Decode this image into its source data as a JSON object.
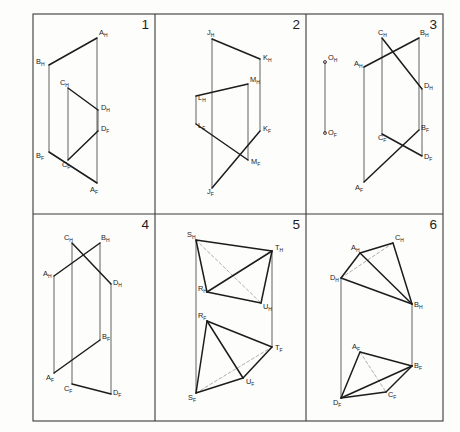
{
  "sheet": {
    "title": "Descriptive Geometry Worksheet",
    "background_color": "#fdfdfb",
    "line_color": "#1c1c1c",
    "hidden_line_color": "#9a9a9a",
    "border_color": "#3a3a3a",
    "grid": {
      "columns": 3,
      "rows": 2
    }
  },
  "panels": [
    {
      "number": "1",
      "kind": "two-skew-lines",
      "description": "Two line segments AB and CD shown in H and F views with vertical projection lines",
      "points": [
        {
          "name": "A_H",
          "label": "A",
          "sub": "H",
          "x": 97,
          "y": 38,
          "lx": 99,
          "ly": 35
        },
        {
          "name": "B_H",
          "label": "B",
          "sub": "H",
          "x": 49,
          "y": 65,
          "lx": 36,
          "ly": 64
        },
        {
          "name": "C_H",
          "label": "C",
          "sub": "H",
          "x": 68,
          "y": 88,
          "lx": 60,
          "ly": 85
        },
        {
          "name": "D_H",
          "label": "D",
          "sub": "H",
          "x": 98,
          "y": 110,
          "lx": 101,
          "ly": 110
        },
        {
          "name": "D_F",
          "label": "D",
          "sub": "F",
          "x": 98,
          "y": 131,
          "lx": 101,
          "ly": 131
        },
        {
          "name": "C_F",
          "label": "C",
          "sub": "F",
          "x": 68,
          "y": 160,
          "lx": 62,
          "ly": 167
        },
        {
          "name": "B_F",
          "label": "B",
          "sub": "F",
          "x": 49,
          "y": 152,
          "lx": 36,
          "ly": 158
        },
        {
          "name": "A_F",
          "label": "A",
          "sub": "F",
          "x": 97,
          "y": 183,
          "lx": 90,
          "ly": 192
        }
      ],
      "solid_lines": [
        {
          "from": "A_H",
          "to": "B_H"
        },
        {
          "from": "C_H",
          "to": "D_H"
        },
        {
          "from": "B_F",
          "to": "A_F"
        },
        {
          "from": "C_F",
          "to": "D_F"
        }
      ],
      "projection_lines": [
        {
          "from": "A_H",
          "to": "A_F"
        },
        {
          "from": "B_H",
          "to": "B_F"
        },
        {
          "from": "C_H",
          "to": "C_F"
        },
        {
          "from": "D_H",
          "to": "D_F"
        }
      ]
    },
    {
      "number": "2",
      "kind": "two-skew-lines",
      "description": "Line segments JK and LM shown in H and F views",
      "points": [
        {
          "name": "J_H",
          "label": "J",
          "sub": "H",
          "x": 212,
          "y": 39,
          "lx": 207,
          "ly": 35
        },
        {
          "name": "K_H",
          "label": "K",
          "sub": "H",
          "x": 260,
          "y": 59,
          "lx": 263,
          "ly": 60
        },
        {
          "name": "M_H",
          "label": "M",
          "sub": "H",
          "x": 248,
          "y": 84,
          "lx": 250,
          "ly": 82
        },
        {
          "name": "L_H",
          "label": "L",
          "sub": "H",
          "x": 196,
          "y": 96,
          "lx": 198,
          "ly": 100
        },
        {
          "name": "L_F",
          "label": "L",
          "sub": "F",
          "x": 196,
          "y": 124,
          "lx": 198,
          "ly": 128
        },
        {
          "name": "K_F",
          "label": "K",
          "sub": "F",
          "x": 260,
          "y": 131,
          "lx": 263,
          "ly": 131
        },
        {
          "name": "M_F",
          "label": "M",
          "sub": "F",
          "x": 248,
          "y": 160,
          "lx": 251,
          "ly": 164
        },
        {
          "name": "J_F",
          "label": "J",
          "sub": "F",
          "x": 212,
          "y": 188,
          "lx": 207,
          "ly": 194
        }
      ],
      "solid_lines": [
        {
          "from": "J_H",
          "to": "K_H"
        },
        {
          "from": "L_H",
          "to": "M_H"
        },
        {
          "from": "L_F",
          "to": "M_F"
        },
        {
          "from": "J_F",
          "to": "K_F"
        }
      ],
      "projection_lines": [
        {
          "from": "J_H",
          "to": "J_F"
        },
        {
          "from": "K_H",
          "to": "K_F"
        },
        {
          "from": "L_H",
          "to": "L_F"
        },
        {
          "from": "M_H",
          "to": "M_F"
        }
      ]
    },
    {
      "number": "3",
      "kind": "point-and-two-lines",
      "description": "Isolated point O with its projections, plus crossing line segments AB and CD",
      "points": [
        {
          "name": "O_H",
          "label": "O",
          "sub": "H",
          "x": 325,
          "y": 62,
          "lx": 328,
          "ly": 60
        },
        {
          "name": "O_F",
          "label": "O",
          "sub": "F",
          "x": 325,
          "y": 133,
          "lx": 328,
          "ly": 135
        },
        {
          "name": "C_H",
          "label": "C",
          "sub": "H",
          "x": 382,
          "y": 38,
          "lx": 378,
          "ly": 35
        },
        {
          "name": "B_H",
          "label": "B",
          "sub": "H",
          "x": 419,
          "y": 38,
          "lx": 420,
          "ly": 35
        },
        {
          "name": "A_H",
          "label": "A",
          "sub": "H",
          "x": 364,
          "y": 67,
          "lx": 354,
          "ly": 66
        },
        {
          "name": "D_H",
          "label": "D",
          "sub": "H",
          "x": 422,
          "y": 89,
          "lx": 424,
          "ly": 88
        },
        {
          "name": "C_F",
          "label": "C",
          "sub": "F",
          "x": 382,
          "y": 134,
          "lx": 378,
          "ly": 140
        },
        {
          "name": "B_F",
          "label": "B",
          "sub": "F",
          "x": 419,
          "y": 130,
          "lx": 421,
          "ly": 130
        },
        {
          "name": "D_F",
          "label": "D",
          "sub": "F",
          "x": 422,
          "y": 156,
          "lx": 424,
          "ly": 159
        },
        {
          "name": "A_F",
          "label": "A",
          "sub": "F",
          "x": 364,
          "y": 182,
          "lx": 355,
          "ly": 190
        }
      ],
      "solid_lines": [
        {
          "from": "A_H",
          "to": "B_H"
        },
        {
          "from": "C_H",
          "to": "D_H"
        },
        {
          "from": "A_F",
          "to": "B_F"
        },
        {
          "from": "C_F",
          "to": "D_F"
        }
      ],
      "projection_lines": [
        {
          "from": "O_H",
          "to": "O_F"
        },
        {
          "from": "A_H",
          "to": "A_F"
        },
        {
          "from": "B_H",
          "to": "B_F"
        },
        {
          "from": "C_H",
          "to": "C_F"
        },
        {
          "from": "D_H",
          "to": "D_F"
        }
      ],
      "point_markers": [
        "O_H",
        "O_F"
      ]
    },
    {
      "number": "4",
      "kind": "two-skew-lines",
      "description": "Crossing line segments AB and CD in the H view, separated in the F view",
      "points": [
        {
          "name": "C_H",
          "label": "C",
          "sub": "H",
          "x": 72,
          "y": 243,
          "lx": 64,
          "ly": 240
        },
        {
          "name": "B_H",
          "label": "B",
          "sub": "H",
          "x": 100,
          "y": 243,
          "lx": 101,
          "ly": 240
        },
        {
          "name": "A_H",
          "label": "A",
          "sub": "H",
          "x": 54,
          "y": 276,
          "lx": 43,
          "ly": 276
        },
        {
          "name": "D_H",
          "label": "D",
          "sub": "H",
          "x": 111,
          "y": 284,
          "lx": 113,
          "ly": 285
        },
        {
          "name": "B_F",
          "label": "B",
          "sub": "F",
          "x": 100,
          "y": 340,
          "lx": 102,
          "ly": 339
        },
        {
          "name": "A_F",
          "label": "A",
          "sub": "F",
          "x": 54,
          "y": 373,
          "lx": 46,
          "ly": 380
        },
        {
          "name": "C_F",
          "label": "C",
          "sub": "F",
          "x": 72,
          "y": 384,
          "lx": 64,
          "ly": 391
        },
        {
          "name": "D_F",
          "label": "D",
          "sub": "F",
          "x": 111,
          "y": 394,
          "lx": 113,
          "ly": 395
        }
      ],
      "solid_lines": [
        {
          "from": "A_H",
          "to": "B_H"
        },
        {
          "from": "C_H",
          "to": "D_H"
        },
        {
          "from": "A_F",
          "to": "B_F"
        },
        {
          "from": "C_F",
          "to": "D_F"
        }
      ],
      "projection_lines": [
        {
          "from": "A_H",
          "to": "A_F"
        },
        {
          "from": "B_H",
          "to": "B_F"
        },
        {
          "from": "C_H",
          "to": "C_F"
        },
        {
          "from": "D_H",
          "to": "D_F"
        }
      ]
    },
    {
      "number": "5",
      "kind": "tetrahedron",
      "description": "Tetrahedron RSTU shown in H and F views with one hidden edge dashed in each view",
      "points": [
        {
          "name": "S_H",
          "label": "S",
          "sub": "H",
          "x": 196,
          "y": 240,
          "lx": 187,
          "ly": 237
        },
        {
          "name": "T_H",
          "label": "T",
          "sub": "H",
          "x": 272,
          "y": 251,
          "lx": 275,
          "ly": 250
        },
        {
          "name": "R_H",
          "label": "R",
          "sub": "H",
          "x": 207,
          "y": 292,
          "lx": 198,
          "ly": 291
        },
        {
          "name": "U_H",
          "label": "U",
          "sub": "H",
          "x": 261,
          "y": 303,
          "lx": 263,
          "ly": 309
        },
        {
          "name": "R_F",
          "label": "R",
          "sub": "F",
          "x": 207,
          "y": 321,
          "lx": 198,
          "ly": 318
        },
        {
          "name": "T_F",
          "label": "T",
          "sub": "F",
          "x": 272,
          "y": 347,
          "lx": 275,
          "ly": 350
        },
        {
          "name": "U_F",
          "label": "U",
          "sub": "F",
          "x": 243,
          "y": 378,
          "lx": 246,
          "ly": 384
        },
        {
          "name": "S_F",
          "label": "S",
          "sub": "F",
          "x": 196,
          "y": 393,
          "lx": 188,
          "ly": 400
        }
      ],
      "solid_lines": [
        {
          "from": "S_H",
          "to": "T_H"
        },
        {
          "from": "S_H",
          "to": "R_H"
        },
        {
          "from": "R_H",
          "to": "U_H"
        },
        {
          "from": "U_H",
          "to": "T_H"
        },
        {
          "from": "R_H",
          "to": "T_H"
        },
        {
          "from": "R_F",
          "to": "T_F"
        },
        {
          "from": "R_F",
          "to": "S_F"
        },
        {
          "from": "S_F",
          "to": "U_F"
        },
        {
          "from": "U_F",
          "to": "T_F"
        },
        {
          "from": "R_F",
          "to": "U_F"
        }
      ],
      "hidden_lines": [
        {
          "from": "S_H",
          "to": "U_H"
        },
        {
          "from": "S_F",
          "to": "T_F"
        }
      ],
      "projection_lines": [
        {
          "from": "S_H",
          "to": "S_F"
        },
        {
          "from": "T_H",
          "to": "T_F"
        }
      ]
    },
    {
      "number": "6",
      "kind": "tetrahedron",
      "description": "Tetrahedron ABCD shown in H and F views with one hidden edge dashed in each view",
      "points": [
        {
          "name": "A_H",
          "label": "A",
          "sub": "H",
          "x": 360,
          "y": 253,
          "lx": 351,
          "ly": 250
        },
        {
          "name": "C_H",
          "label": "C",
          "sub": "H",
          "x": 393,
          "y": 243,
          "lx": 395,
          "ly": 240
        },
        {
          "name": "D_H",
          "label": "D",
          "sub": "H",
          "x": 341,
          "y": 278,
          "lx": 330,
          "ly": 280
        },
        {
          "name": "B_H",
          "label": "B",
          "sub": "H",
          "x": 412,
          "y": 304,
          "lx": 414,
          "ly": 307
        },
        {
          "name": "A_F",
          "label": "A",
          "sub": "F",
          "x": 360,
          "y": 352,
          "lx": 352,
          "ly": 349
        },
        {
          "name": "B_F",
          "label": "B",
          "sub": "F",
          "x": 412,
          "y": 366,
          "lx": 414,
          "ly": 368
        },
        {
          "name": "C_F",
          "label": "C",
          "sub": "F",
          "x": 386,
          "y": 392,
          "lx": 388,
          "ly": 397
        },
        {
          "name": "D_F",
          "label": "D",
          "sub": "F",
          "x": 341,
          "y": 398,
          "lx": 333,
          "ly": 405
        }
      ],
      "solid_lines": [
        {
          "from": "A_H",
          "to": "C_H"
        },
        {
          "from": "A_H",
          "to": "D_H"
        },
        {
          "from": "D_H",
          "to": "B_H"
        },
        {
          "from": "C_H",
          "to": "B_H"
        },
        {
          "from": "A_H",
          "to": "B_H"
        },
        {
          "from": "A_F",
          "to": "B_F"
        },
        {
          "from": "A_F",
          "to": "D_F"
        },
        {
          "from": "D_F",
          "to": "C_F"
        },
        {
          "from": "C_F",
          "to": "B_F"
        },
        {
          "from": "D_F",
          "to": "B_F"
        }
      ],
      "hidden_lines": [
        {
          "from": "D_H",
          "to": "C_H"
        },
        {
          "from": "A_F",
          "to": "C_F"
        }
      ],
      "projection_lines": [
        {
          "from": "D_H",
          "to": "D_F"
        },
        {
          "from": "B_H",
          "to": "B_F"
        }
      ]
    }
  ],
  "frame": {
    "left": 33,
    "top": 14,
    "right": 443,
    "bottom": 421,
    "mid_x1": 155,
    "mid_x2": 306,
    "mid_y": 214
  }
}
